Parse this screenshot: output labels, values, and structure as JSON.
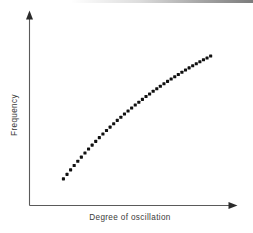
{
  "chart_data": {
    "type": "scatter",
    "title": "",
    "subtitle": "",
    "xlabel": "Degree of oscillation",
    "ylabel": "Frequency",
    "xlim": [
      0,
      10
    ],
    "ylim": [
      0,
      10
    ],
    "grid": false,
    "legend": null,
    "tick_labels_x": [],
    "tick_labels_y": [],
    "annotations": [],
    "marker": {
      "shape": "square-dot",
      "color": "#111111",
      "size_px": 3.1
    },
    "series": [
      {
        "name": "Frequency vs degree of oscillation",
        "x": [
          1.7,
          1.88,
          2.06,
          2.24,
          2.42,
          2.6,
          2.78,
          2.96,
          3.14,
          3.32,
          3.5,
          3.68,
          3.86,
          4.04,
          4.22,
          4.4,
          4.58,
          4.76,
          4.94,
          5.12,
          5.3,
          5.48,
          5.66,
          5.84,
          6.02,
          6.2,
          6.38,
          6.56,
          6.74,
          6.92,
          7.1,
          7.28,
          7.46,
          7.64,
          7.82,
          8.0,
          8.18,
          8.36,
          8.54,
          8.72,
          8.9,
          9.08
        ],
        "y": [
          1.42,
          1.66,
          1.9,
          2.13,
          2.36,
          2.58,
          2.8,
          3.01,
          3.22,
          3.42,
          3.62,
          3.81,
          4.0,
          4.18,
          4.36,
          4.54,
          4.71,
          4.88,
          5.04,
          5.2,
          5.36,
          5.51,
          5.66,
          5.81,
          5.95,
          6.09,
          6.23,
          6.36,
          6.49,
          6.62,
          6.75,
          6.87,
          6.99,
          7.11,
          7.23,
          7.34,
          7.45,
          7.56,
          7.67,
          7.77,
          7.87,
          7.97
        ],
        "shape": "monotonic increasing, concave down"
      }
    ]
  },
  "axes": {
    "x_axis_name": "x-axis",
    "y_axis_name": "y-axis",
    "x_arrow_direction": "right",
    "y_arrow_direction": "up"
  }
}
